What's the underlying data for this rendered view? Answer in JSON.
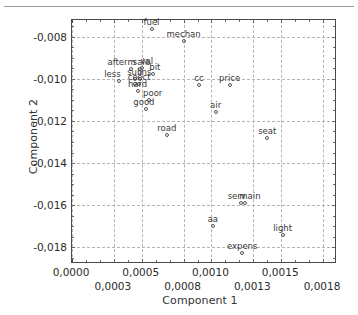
{
  "chart_data": {
    "type": "scatter",
    "title": "",
    "xlabel": "Component 1",
    "ylabel": "Component 2",
    "xlim": [
      0.0,
      0.0019
    ],
    "ylim": [
      -0.0188,
      -0.0072
    ],
    "grid": true,
    "legend": null,
    "decimal_separator": ",",
    "xticks_row1": [
      "0,0000",
      "0,0005",
      "0,0010",
      "0,0015"
    ],
    "xticks_row1_values": [
      0.0,
      0.0005,
      0.001,
      0.0015
    ],
    "xticks_row2": [
      "0,0003",
      "0,0008",
      "0,0013",
      "0,0018"
    ],
    "xticks_row2_values": [
      0.0003,
      0.0008,
      0.0013,
      0.0018
    ],
    "yticks": [
      "-0,008",
      "-0,010",
      "-0,012",
      "-0,014",
      "-0,016",
      "-0,018"
    ],
    "yticks_values": [
      -0.008,
      -0.01,
      -0.012,
      -0.014,
      -0.016,
      -0.018
    ],
    "marker": "open-circle",
    "points": [
      {
        "label": "fuel",
        "x": 0.00057,
        "y": -0.00765,
        "lx": 0,
        "ly": -3
      },
      {
        "label": "mechan",
        "x": 0.0008,
        "y": -0.00818,
        "lx": 0,
        "ly": -3
      },
      {
        "label": "afterm",
        "x": 0.00042,
        "y": -0.00952,
        "lx": -9,
        "ly": -3
      },
      {
        "label": "sale",
        "x": 0.00049,
        "y": -0.00953,
        "lx": 1,
        "ly": -3
      },
      {
        "label": "val",
        "x": 0.0005,
        "y": -0.0095,
        "lx": 5,
        "ly": -3
      },
      {
        "label": "bit",
        "x": 0.00058,
        "y": -0.00975,
        "lx": 2,
        "ly": -3
      },
      {
        "label": "less",
        "x": 0.00034,
        "y": -0.0101,
        "lx": -7,
        "ly": -3
      },
      {
        "label": "sub",
        "x": 0.00045,
        "y": -0.01,
        "lx": 0,
        "ly": -3
      },
      {
        "label": "ins",
        "x": 0.00049,
        "y": -0.01002,
        "lx": 5,
        "ly": -3
      },
      {
        "label": "co",
        "x": 0.00045,
        "y": -0.01026,
        "lx": -2,
        "ly": -3
      },
      {
        "label": "ect",
        "x": 0.00048,
        "y": -0.01024,
        "lx": 5,
        "ly": -3
      },
      {
        "label": "hard",
        "x": 0.00047,
        "y": -0.01058,
        "lx": 0,
        "ly": -3
      },
      {
        "label": "cc",
        "x": 0.00091,
        "y": -0.0103,
        "lx": 0,
        "ly": -3
      },
      {
        "label": "price",
        "x": 0.00113,
        "y": -0.01028,
        "lx": 0,
        "ly": -3
      },
      {
        "label": "poor",
        "x": 0.00055,
        "y": -0.011,
        "lx": 4,
        "ly": -3
      },
      {
        "label": "good",
        "x": 0.00053,
        "y": -0.01145,
        "lx": -2,
        "ly": -3
      },
      {
        "label": "air",
        "x": 0.00103,
        "y": -0.01158,
        "lx": 0,
        "ly": -3
      },
      {
        "label": "road",
        "x": 0.00068,
        "y": -0.01268,
        "lx": 0,
        "ly": -3
      },
      {
        "label": "seat",
        "x": 0.0014,
        "y": -0.01282,
        "lx": 0,
        "ly": -3
      },
      {
        "label": "serv",
        "x": 0.00121,
        "y": -0.0159,
        "lx": -4,
        "ly": -3
      },
      {
        "label": "main",
        "x": 0.00124,
        "y": -0.01592,
        "lx": 5,
        "ly": -3
      },
      {
        "label": "aa",
        "x": 0.00101,
        "y": -0.017,
        "lx": 0,
        "ly": -3
      },
      {
        "label": "light",
        "x": 0.00151,
        "y": -0.01742,
        "lx": 0,
        "ly": -3
      },
      {
        "label": "expens",
        "x": 0.00122,
        "y": -0.01828,
        "lx": 0,
        "ly": -3
      }
    ]
  }
}
